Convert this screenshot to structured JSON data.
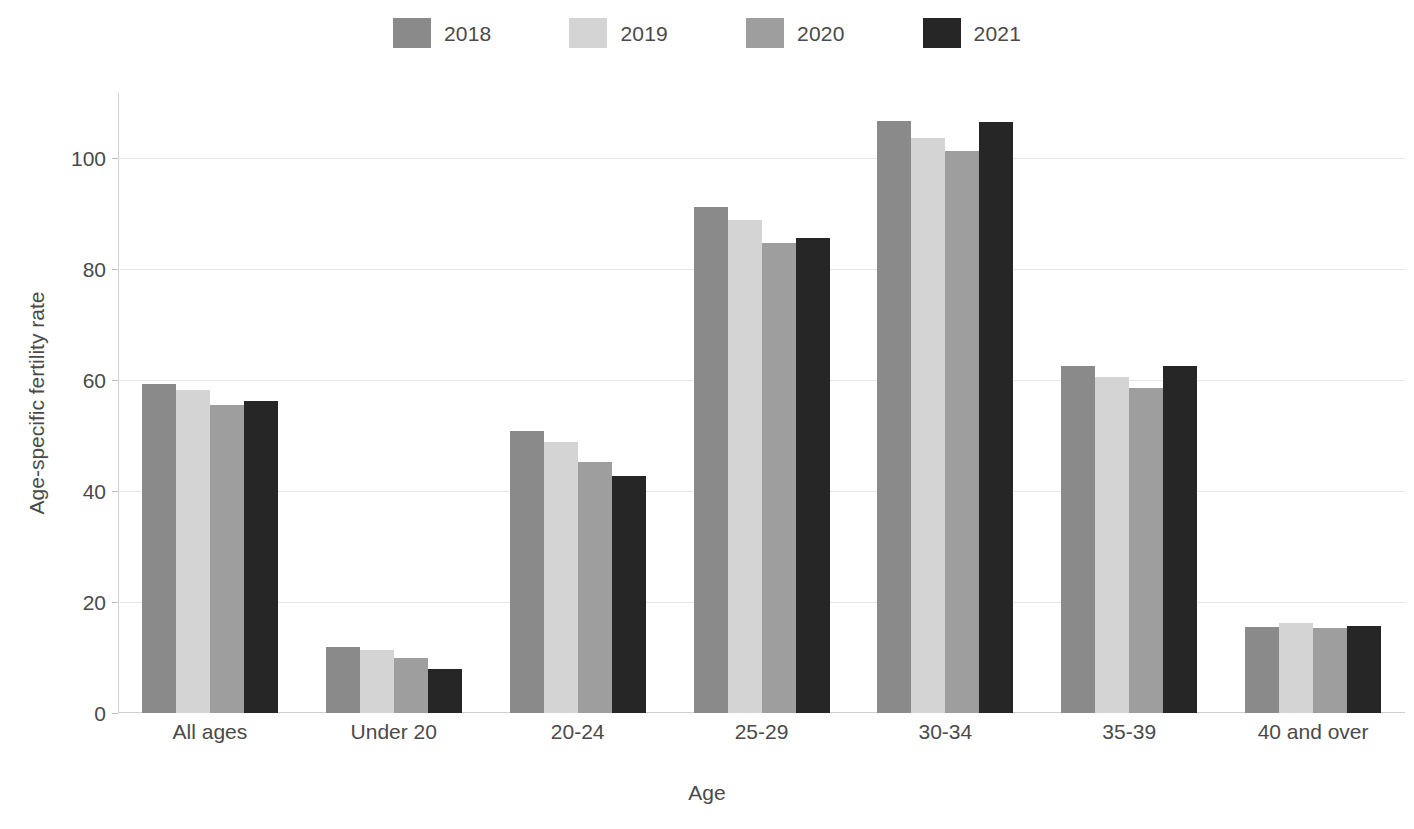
{
  "chart_data": {
    "type": "bar",
    "title": "",
    "subtitle": "",
    "xlabel": "Age",
    "ylabel": "Age-specific fertility rate",
    "categories": [
      "All ages",
      "Under 20",
      "20-24",
      "25-29",
      "30-34",
      "35-39",
      "40 and over"
    ],
    "series": [
      {
        "name": "2018",
        "color": "#8a8a8a",
        "values": [
          59.2,
          11.9,
          50.8,
          91.2,
          106.7,
          62.6,
          15.5
        ]
      },
      {
        "name": "2019",
        "color": "#d4d4d4",
        "values": [
          58.2,
          11.3,
          48.8,
          88.8,
          103.6,
          60.5,
          16.2
        ]
      },
      {
        "name": "2020",
        "color": "#9e9e9e",
        "values": [
          55.5,
          9.9,
          45.3,
          84.6,
          101.3,
          58.6,
          15.3
        ]
      },
      {
        "name": "2021",
        "color": "#262626",
        "values": [
          56.2,
          8.0,
          42.7,
          85.6,
          106.4,
          62.6,
          15.6
        ]
      }
    ],
    "ylim": [
      0,
      110
    ],
    "yticks": [
      0,
      20,
      40,
      60,
      80,
      100
    ],
    "ytick_labels": [
      "0",
      "20",
      "40",
      "60",
      "80",
      "100"
    ],
    "grid": true,
    "grid_axis": "y",
    "legend_position": "top-center",
    "background_color": "#ffffff",
    "axis_color": "#cfcfcf",
    "grid_color": "#e8e8e8",
    "text_color": "#4a4a4a"
  },
  "legend": {
    "items": [
      {
        "label": "2018",
        "color": "#8a8a8a"
      },
      {
        "label": "2019",
        "color": "#d4d4d4"
      },
      {
        "label": "2020",
        "color": "#9e9e9e"
      },
      {
        "label": "2021",
        "color": "#262626"
      }
    ]
  },
  "axes": {
    "x_title": "Age",
    "y_title": "Age-specific fertility rate"
  }
}
